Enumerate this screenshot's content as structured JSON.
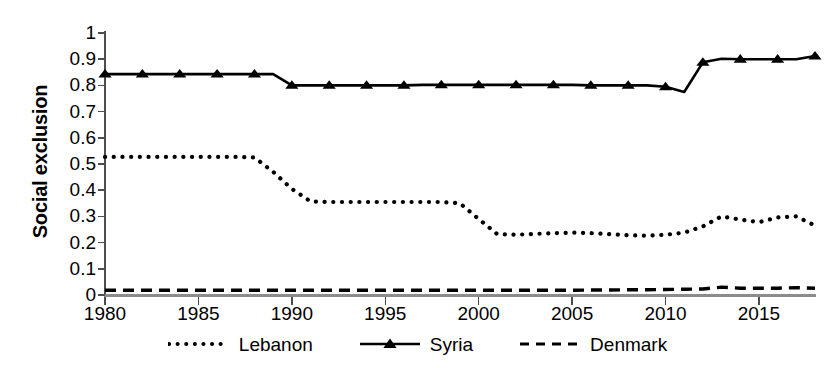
{
  "chart_data": {
    "type": "line",
    "title": "",
    "xlabel": "",
    "ylabel": "Social exclusion",
    "xlim": [
      1980,
      2018
    ],
    "ylim": [
      0,
      1
    ],
    "grid": false,
    "legend_position": "bottom",
    "xticks": [
      1980,
      1985,
      1990,
      1995,
      2000,
      2005,
      2010,
      2015
    ],
    "yticks": [
      0,
      0.1,
      0.2,
      0.3,
      0.4,
      0.5,
      0.6,
      0.7,
      0.8,
      0.9,
      1
    ],
    "x": [
      1980,
      1981,
      1982,
      1983,
      1984,
      1985,
      1986,
      1987,
      1988,
      1989,
      1990,
      1991,
      1992,
      1993,
      1994,
      1995,
      1996,
      1997,
      1998,
      1999,
      2000,
      2001,
      2002,
      2003,
      2004,
      2005,
      2006,
      2007,
      2008,
      2009,
      2010,
      2011,
      2012,
      2013,
      2014,
      2015,
      2016,
      2017,
      2018
    ],
    "series": [
      {
        "name": "Lebanon",
        "style": "dotted",
        "marker": "none",
        "color": "#000000",
        "values": [
          0.527,
          0.527,
          0.527,
          0.527,
          0.527,
          0.527,
          0.527,
          0.527,
          0.525,
          0.47,
          0.405,
          0.357,
          0.355,
          0.355,
          0.355,
          0.355,
          0.355,
          0.355,
          0.355,
          0.35,
          0.29,
          0.232,
          0.23,
          0.233,
          0.236,
          0.238,
          0.236,
          0.232,
          0.228,
          0.226,
          0.23,
          0.238,
          0.262,
          0.3,
          0.288,
          0.278,
          0.296,
          0.3,
          0.265
        ]
      },
      {
        "name": "Syria",
        "style": "solid",
        "marker": "triangle",
        "color": "#000000",
        "values": [
          0.843,
          0.843,
          0.843,
          0.843,
          0.843,
          0.843,
          0.843,
          0.843,
          0.843,
          0.843,
          0.8,
          0.8,
          0.8,
          0.8,
          0.8,
          0.8,
          0.8,
          0.802,
          0.802,
          0.802,
          0.802,
          0.802,
          0.802,
          0.802,
          0.802,
          0.802,
          0.8,
          0.8,
          0.8,
          0.8,
          0.795,
          0.775,
          0.888,
          0.902,
          0.9,
          0.9,
          0.9,
          0.9,
          0.912
        ]
      },
      {
        "name": "Denmark",
        "style": "dashed",
        "marker": "none",
        "color": "#000000",
        "values": [
          0.018,
          0.018,
          0.018,
          0.018,
          0.018,
          0.018,
          0.018,
          0.018,
          0.018,
          0.018,
          0.018,
          0.018,
          0.018,
          0.018,
          0.018,
          0.018,
          0.018,
          0.018,
          0.018,
          0.018,
          0.018,
          0.018,
          0.018,
          0.018,
          0.018,
          0.018,
          0.019,
          0.019,
          0.02,
          0.02,
          0.021,
          0.022,
          0.023,
          0.03,
          0.026,
          0.026,
          0.026,
          0.028,
          0.026
        ]
      }
    ]
  },
  "axis": {
    "y_title": "Social exclusion",
    "y_tick_labels": [
      "1",
      "0.9",
      "0.8",
      "0.7",
      "0.6",
      "0.5",
      "0.4",
      "0.3",
      "0.2",
      "0.1",
      "0"
    ],
    "x_tick_labels": [
      "1980",
      "1985",
      "1990",
      "1995",
      "2000",
      "2005",
      "2010",
      "2015"
    ]
  },
  "legend": {
    "items": [
      {
        "label": "Lebanon",
        "icon": "dotted-line-swatch"
      },
      {
        "label": "Syria",
        "icon": "triangle-line-swatch"
      },
      {
        "label": "Denmark",
        "icon": "dashed-line-swatch"
      }
    ]
  }
}
